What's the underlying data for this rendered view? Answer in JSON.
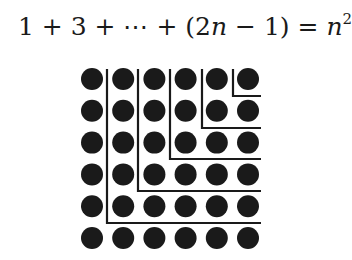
{
  "equation": {
    "text": "1 + 3 + ⋯ + (2n − 1) = n²",
    "parts": {
      "lhs_terms": "1 + 3 + ⋯ + (2",
      "var_n": "n",
      "minus_one": " − 1) = ",
      "rhs_base": "n",
      "rhs_exp": "2"
    }
  },
  "diagram": {
    "type": "dot-grid-with-gnomons",
    "rows": 6,
    "cols": 6,
    "dot_color": "#1a1a1a",
    "line_color": "#1a1a1a",
    "background": "#ffffff",
    "grid": {
      "x0": 92,
      "y0": 79,
      "dx": 31.2,
      "dy": 31.8,
      "dot_radius": 11
    },
    "gnomons": [
      {
        "k": 1,
        "vx": 233,
        "hy": 96,
        "top": 69,
        "right": 261,
        "count": 1
      },
      {
        "k": 2,
        "vx": 202,
        "hy": 128,
        "top": 69,
        "right": 261,
        "count": 3
      },
      {
        "k": 3,
        "vx": 170,
        "hy": 159,
        "top": 69,
        "right": 261,
        "count": 5
      },
      {
        "k": 4,
        "vx": 138,
        "hy": 191,
        "top": 69,
        "right": 261,
        "count": 7
      },
      {
        "k": 5,
        "vx": 107,
        "hy": 223,
        "top": 69,
        "right": 261,
        "count": 9
      }
    ],
    "remaining_gnomon_count": 11,
    "total_dots": 36
  }
}
